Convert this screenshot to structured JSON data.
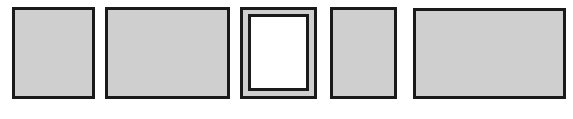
{
  "diagram": {
    "colors": {
      "panel_fill": "#cfcfcf",
      "border": "#1a1a1a",
      "frame_inner_fill": "#ffffff",
      "background": "#ffffff"
    },
    "panels": [
      {
        "id": "panel-1",
        "type": "filled",
        "x": 12,
        "y": 7,
        "w": 83,
        "h": 92
      },
      {
        "id": "panel-2",
        "type": "filled",
        "x": 105,
        "y": 7,
        "w": 125,
        "h": 92
      },
      {
        "id": "panel-3",
        "type": "framed",
        "x": 240,
        "y": 7,
        "w": 77,
        "h": 92,
        "inner": {
          "x": 248,
          "y": 14,
          "w": 61,
          "h": 77
        }
      },
      {
        "id": "panel-4",
        "type": "filled",
        "x": 330,
        "y": 7,
        "w": 67,
        "h": 92
      },
      {
        "id": "panel-5",
        "type": "filled",
        "x": 413,
        "y": 8,
        "w": 153,
        "h": 91
      }
    ]
  }
}
